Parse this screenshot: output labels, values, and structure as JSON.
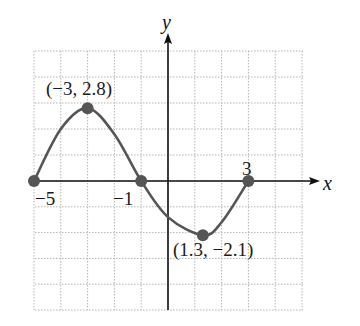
{
  "chart_data": {
    "type": "line",
    "title": "",
    "xlabel": "x",
    "ylabel": "y",
    "xlim": [
      -5,
      5
    ],
    "ylim": [
      -5,
      5
    ],
    "grid": true,
    "grid_style": "dotted",
    "legend": null,
    "series": [
      {
        "name": "f(x)",
        "color": "#555555",
        "points": [
          [
            -5,
            0
          ],
          [
            -4,
            2.0
          ],
          [
            -3,
            2.8
          ],
          [
            -2,
            1.8
          ],
          [
            -1,
            0
          ],
          [
            0,
            -1.4
          ],
          [
            1.3,
            -2.1
          ],
          [
            2,
            -1.6
          ],
          [
            3,
            0
          ]
        ]
      }
    ],
    "marked_points": [
      {
        "x": -5,
        "y": 0,
        "label": "−5"
      },
      {
        "x": -3,
        "y": 2.8,
        "label": "(−3, 2.8)"
      },
      {
        "x": -1,
        "y": 0,
        "label": "−1"
      },
      {
        "x": 1.3,
        "y": -2.1,
        "label": "(1.3, −2.1)"
      },
      {
        "x": 3,
        "y": 0,
        "label": "3"
      }
    ],
    "colors": {
      "curve": "#555555",
      "points": "#555555",
      "axes": "#111111",
      "grid": "#b5b5b5"
    }
  },
  "labels": {
    "x_axis": "x",
    "y_axis": "y",
    "max_point": "(−3, 2.8)",
    "min_point": "(1.3, −2.1)",
    "zero_left": "−5",
    "zero_mid": "−1",
    "zero_right": "3"
  }
}
